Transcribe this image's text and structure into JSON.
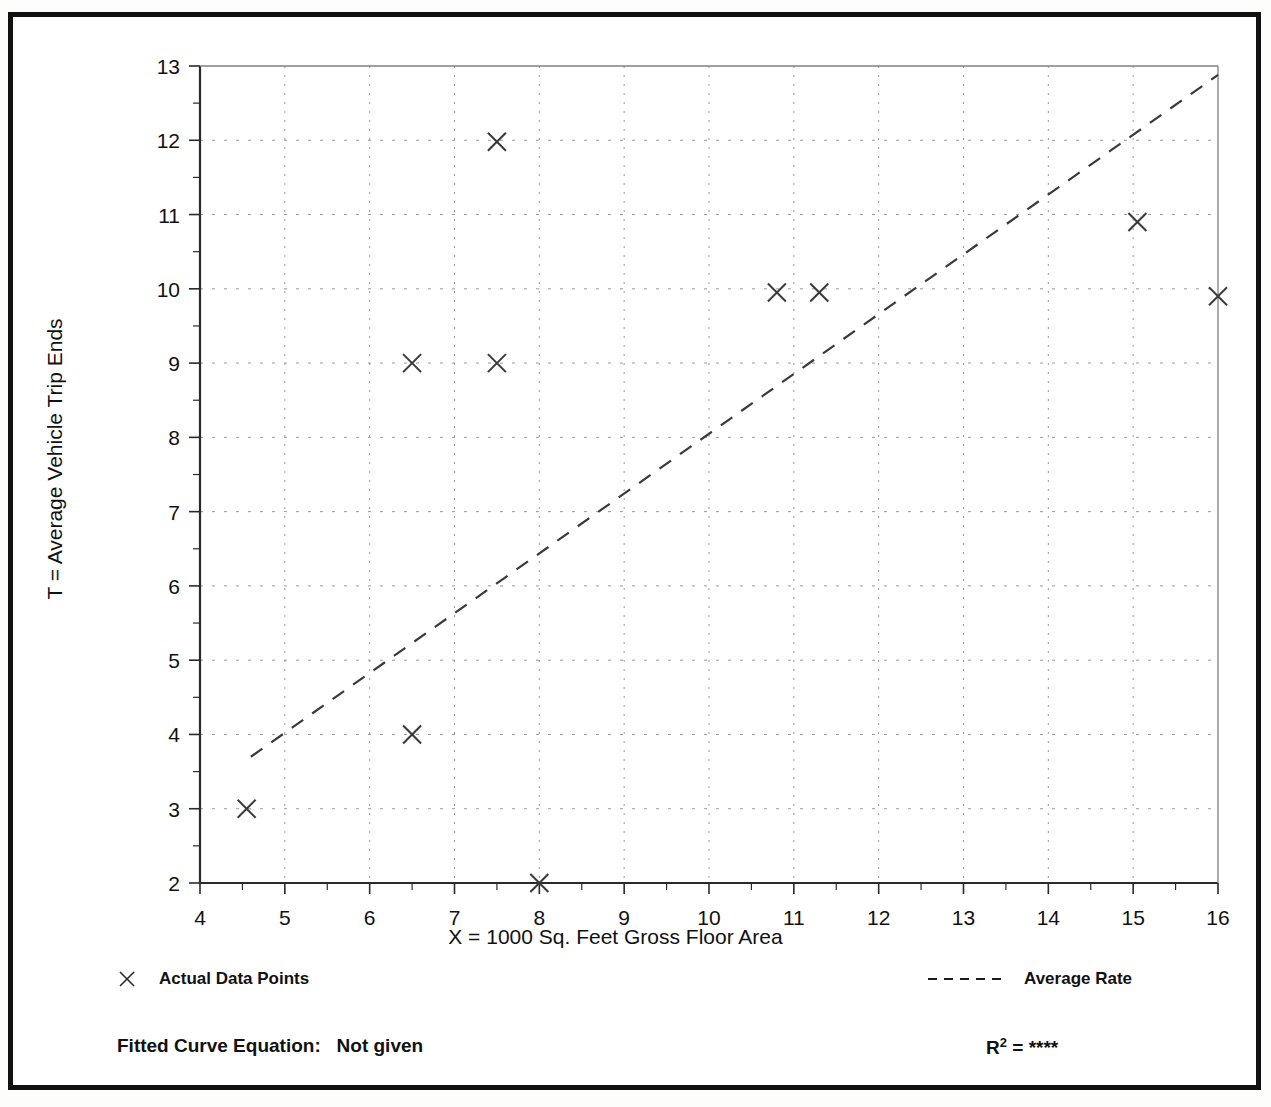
{
  "page": {
    "title_fragment": "",
    "background": "#ffffff",
    "frame_color": "#111111"
  },
  "chart_data": {
    "type": "scatter",
    "title": "",
    "xlabel": "X = 1000 Sq. Feet Gross Floor Area",
    "ylabel": "T = Average Vehicle Trip Ends",
    "xlim": [
      4,
      16
    ],
    "ylim": [
      2,
      13
    ],
    "xticks": [
      4,
      5,
      6,
      7,
      8,
      9,
      10,
      11,
      12,
      13,
      14,
      15,
      16
    ],
    "yticks": [
      2,
      3,
      4,
      5,
      6,
      7,
      8,
      9,
      10,
      11,
      12,
      13
    ],
    "xtick_labels": [
      "4",
      "5",
      "6",
      "7",
      "8",
      "9",
      "10",
      "11",
      "12",
      "13",
      "14",
      "15",
      "16"
    ],
    "ytick_labels": [
      "2",
      "3",
      "4",
      "5",
      "6",
      "7",
      "8",
      "9",
      "10",
      "11",
      "12",
      "13"
    ],
    "minor_tick_step": 0.5,
    "grid": true,
    "grid_style": "dotted",
    "grid_color": "#9a9a9a",
    "marker": "x",
    "marker_color": "#3a3a3a",
    "series": [
      {
        "name": "Actual Data Points",
        "marker": "x",
        "points": [
          {
            "x": 4.55,
            "y": 3.0
          },
          {
            "x": 6.5,
            "y": 4.0
          },
          {
            "x": 6.5,
            "y": 9.0
          },
          {
            "x": 7.5,
            "y": 9.0
          },
          {
            "x": 7.5,
            "y": 11.98
          },
          {
            "x": 8.0,
            "y": 2.0
          },
          {
            "x": 10.8,
            "y": 9.95
          },
          {
            "x": 11.3,
            "y": 9.95
          },
          {
            "x": 15.05,
            "y": 10.9
          },
          {
            "x": 16.0,
            "y": 9.9
          }
        ]
      },
      {
        "name": "Average Rate",
        "type": "line",
        "style": "dashed",
        "color": "#3a3a3a",
        "endpoints": [
          {
            "x": 4.6,
            "y": 3.7
          },
          {
            "x": 16.0,
            "y": 12.88
          }
        ]
      }
    ],
    "legend": [
      {
        "key": "actual-data-points",
        "label": "Actual Data Points",
        "symbol": "x-marker"
      },
      {
        "key": "average-rate",
        "label": "Average Rate",
        "symbol": "dashed-line"
      }
    ],
    "annotations": {
      "fitted_curve_label": "Fitted Curve Equation:",
      "fitted_curve_value": "Not given",
      "r_squared_label": "R",
      "r_squared_exponent": "2",
      "r_squared_eq": "=",
      "r_squared_value": "****"
    }
  }
}
